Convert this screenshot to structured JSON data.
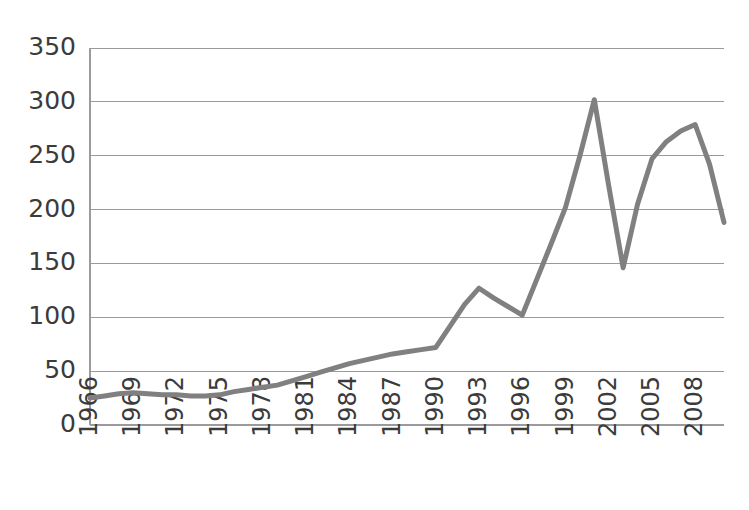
{
  "chart_data": {
    "type": "line",
    "title": "",
    "subtitle": "",
    "xlabel": "",
    "ylabel": "",
    "xlim": [
      1966,
      2010
    ],
    "ylim": [
      0,
      350
    ],
    "grid": true,
    "legend": false,
    "legend_position": "none",
    "line_color": "#808080",
    "line_width": 5,
    "y_ticks": [
      0,
      50,
      100,
      150,
      200,
      250,
      300,
      350
    ],
    "y_tick_labels": [
      "0",
      "50",
      "100",
      "150",
      "200",
      "250",
      "300",
      "350"
    ],
    "x_ticks": [
      1966,
      1969,
      1972,
      1975,
      1978,
      1981,
      1984,
      1987,
      1990,
      1993,
      1996,
      1999,
      2002,
      2005,
      2008
    ],
    "x_tick_labels": [
      "1966",
      "1969",
      "1972",
      "1975",
      "1978",
      "1981",
      "1984",
      "1987",
      "1990",
      "1993",
      "1996",
      "1999",
      "2002",
      "2005",
      "2008"
    ],
    "x_tick_rotation": -90,
    "series": [
      {
        "name": "series-1",
        "color": "#808080",
        "x": [
          1966,
          1967,
          1968,
          1969,
          1970,
          1971,
          1972,
          1973,
          1974,
          1975,
          1976,
          1977,
          1978,
          1979,
          1980,
          1981,
          1982,
          1983,
          1984,
          1985,
          1986,
          1987,
          1988,
          1989,
          1990,
          1991,
          1992,
          1993,
          1994,
          1995,
          1996,
          1997,
          1998,
          1999,
          2000,
          2001,
          2002,
          2003,
          2004,
          2005,
          2006,
          2007,
          2008,
          2009,
          2010
        ],
        "values": [
          25,
          27,
          29,
          30,
          29,
          28,
          28,
          27,
          27,
          28,
          31,
          33,
          35,
          37,
          41,
          45,
          49,
          53,
          57,
          60,
          63,
          66,
          68,
          70,
          72,
          92,
          112,
          127,
          118,
          110,
          102,
          135,
          168,
          202,
          250,
          302,
          222,
          146,
          205,
          247,
          263,
          273,
          279,
          242,
          188
        ]
      }
    ]
  },
  "axes": {
    "plot_left_px": 90,
    "plot_right_px": 724,
    "plot_top_px": 48,
    "plot_bottom_px": 425
  }
}
